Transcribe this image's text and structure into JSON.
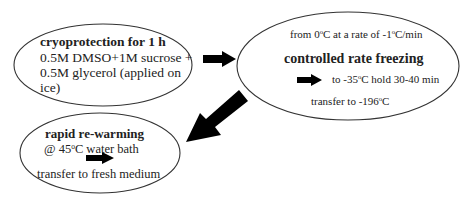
{
  "diagram": {
    "steps": [
      {
        "id": "cryoprotection",
        "title": "cryoprotection for 1 h",
        "lines": [
          "0.5M DMSO+1M sucrose +",
          "0.5M glycerol (applied on",
          "ice)"
        ]
      },
      {
        "id": "controlled-rate-freezing",
        "title": "controlled rate freezing",
        "line_top": {
          "pre": "from 0",
          "sup1": "o",
          "mid": "C at a rate of -1",
          "sup2": "o",
          "post": "C/min"
        },
        "line_arrow": {
          "pre": "to -35",
          "sup": "o",
          "post": "C hold 30-40 min"
        },
        "line_bottom": {
          "pre": "transfer to -196",
          "sup": "o",
          "post": "C"
        }
      },
      {
        "id": "rapid-re-warming",
        "title": "rapid re-warming",
        "line1": {
          "pre": "@ 45",
          "sup": "o",
          "post": "C water bath"
        },
        "line2": "transfer to fresh medium"
      }
    ],
    "colors": {
      "stroke": "#333333",
      "arrow": "#000000",
      "text": "#222222",
      "background": "#ffffff"
    }
  }
}
